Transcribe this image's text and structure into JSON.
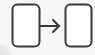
{
  "icon": {
    "name": "flow-arrow-icon",
    "description": "two boxes connected by a right arrow",
    "stroke_color": "#3a3a3a",
    "background_color": "#f7f7f7"
  }
}
